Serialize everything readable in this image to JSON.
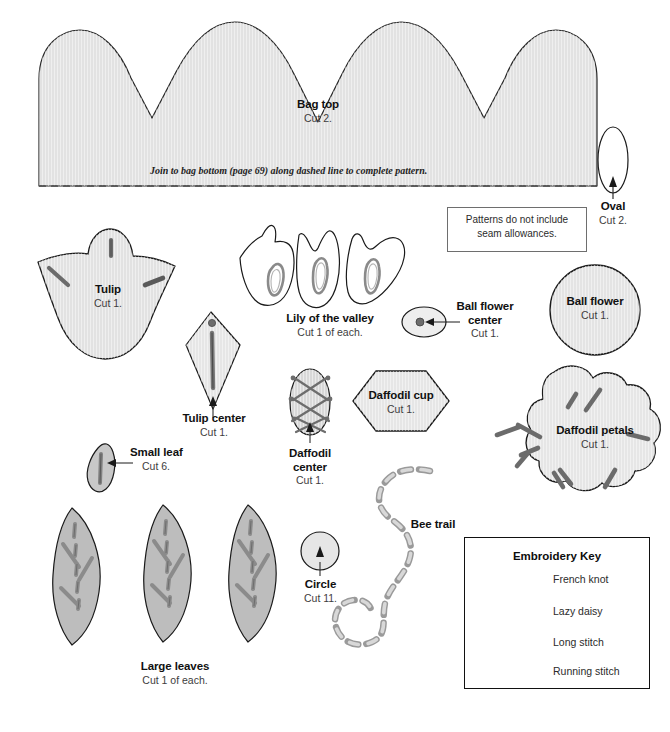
{
  "page": {
    "kind": "sewing-pattern-sheet",
    "background": "#ffffff"
  },
  "colors": {
    "shape_fill_light": "#e8e8e8",
    "shape_fill_mid": "#bfbfbf",
    "shape_outline": "#1a1a1a",
    "stitch_gray": "#6d6d6d",
    "stitch_dark": "#3f3f3f",
    "note_border": "#6e6e6e",
    "key_border": "#111111",
    "text": "#111111",
    "text_sub": "#3d3d3d"
  },
  "pieces": {
    "bag_top": {
      "title": "Bag top",
      "cut": "Cut 2."
    },
    "oval": {
      "title": "Oval",
      "cut": "Cut 2."
    },
    "tulip": {
      "title": "Tulip",
      "cut": "Cut 1."
    },
    "tulip_center": {
      "title": "Tulip center",
      "cut": "Cut 1."
    },
    "lily_of_the_valley": {
      "title": "Lily of the valley",
      "cut": "Cut 1 of each."
    },
    "ball_flower_center": {
      "title_line1": "Ball flower",
      "title_line2": "center",
      "cut": "Cut 1."
    },
    "ball_flower": {
      "title": "Ball flower",
      "cut": "Cut 1."
    },
    "daffodil_cup": {
      "title": "Daffodil cup",
      "cut": "Cut 1."
    },
    "daffodil_center": {
      "title_line1": "Daffodil",
      "title_line2": "center",
      "cut": "Cut 1."
    },
    "daffodil_petals": {
      "title": "Daffodil petals",
      "cut": "Cut 1."
    },
    "small_leaf": {
      "title": "Small leaf",
      "cut": "Cut 6."
    },
    "large_leaves": {
      "title": "Large leaves",
      "cut": "Cut 1 of each."
    },
    "circle": {
      "title": "Circle",
      "cut": "Cut 11."
    },
    "bee_trail": {
      "title": "Bee trail"
    }
  },
  "notes": {
    "join_instruction": "Join to bag bottom (page 69) along dashed line to complete pattern.",
    "seam_allowance_line1": "Patterns do not include",
    "seam_allowance_line2": "seam allowances."
  },
  "embroidery_key": {
    "title": "Embroidery Key",
    "items": [
      {
        "symbol": "french-knot",
        "label": "French knot"
      },
      {
        "symbol": "lazy-daisy",
        "label": "Lazy daisy"
      },
      {
        "symbol": "long-stitch",
        "label": "Long stitch"
      },
      {
        "symbol": "running-stitch",
        "label": "Running stitch"
      }
    ]
  }
}
